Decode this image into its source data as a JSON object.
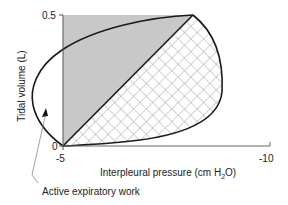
{
  "figure": {
    "type": "pressure-volume loop",
    "y_axis": {
      "label": "Tidal volume (L)",
      "ticks": [
        {
          "value": "0",
          "label": "0"
        },
        {
          "value": "0.5",
          "label": "0.5"
        }
      ]
    },
    "x_axis": {
      "label_main": "Interpleural pressure (cm H",
      "label_sub": "2",
      "label_end": "O)",
      "ticks": [
        {
          "value": "-5",
          "label": "-5"
        },
        {
          "value": "-10",
          "label": "-10"
        }
      ]
    },
    "annotations": {
      "active_expiratory_work": "Active expiratory work"
    },
    "regions": {
      "elastic_work": {
        "fill": "#c8c8c8",
        "pattern": "solid-gray"
      },
      "resistive_work": {
        "fill": "#ffffff",
        "pattern": "crosshatch",
        "stroke": "#9a9a9a"
      }
    },
    "colors": {
      "curve": "#1a1a1a",
      "axis": "#444444",
      "gray_fill": "#c8c8c8",
      "hatch": "#a0a0a0"
    }
  }
}
